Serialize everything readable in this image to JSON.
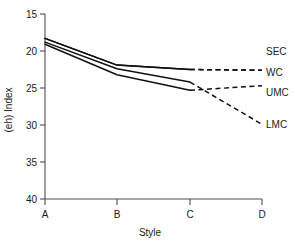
{
  "chart_data": {
    "type": "line",
    "title": "",
    "xlabel": "Style",
    "ylabel": "(eh) Index",
    "categories": [
      "A",
      "B",
      "C",
      "D"
    ],
    "x_ticks": [
      "A",
      "B",
      "C",
      "D"
    ],
    "y_ticks": [
      "15",
      "20",
      "25",
      "30",
      "35",
      "40"
    ],
    "ylim": [
      15,
      40
    ],
    "y_inverted": true,
    "grid": false,
    "legend_position": "right",
    "series": [
      {
        "name": "SEC",
        "label": "SEC",
        "x": [
          "A",
          "B",
          "C",
          "D"
        ],
        "values": [
          18.3,
          21.9,
          22.5,
          22.6
        ],
        "solid_through": "C",
        "dashed_from": "C",
        "legend_label": "SEC"
      },
      {
        "name": "WC",
        "label": "WC",
        "x": [
          "A",
          "B",
          "C",
          "D"
        ],
        "values": [
          18.3,
          21.9,
          22.5,
          22.6
        ],
        "solid_through": "C",
        "dashed_from": "C",
        "legend_label": "WC"
      },
      {
        "name": "UMC",
        "label": "UMC",
        "x": [
          "A",
          "B",
          "C",
          "D"
        ],
        "values": [
          19.1,
          23.2,
          25.3,
          24.7
        ],
        "solid_through": "C",
        "dashed_from": "C",
        "legend_label": "UMC"
      },
      {
        "name": "LMC",
        "label": "LMC",
        "x": [
          "A",
          "B",
          "C",
          "D"
        ],
        "values": [
          18.8,
          22.4,
          24.2,
          29.9
        ],
        "solid_through": "C",
        "dashed_from": "C",
        "legend_label": "LMC"
      }
    ],
    "legend_entries": [
      "SEC",
      "WC",
      "UMC",
      "LMC"
    ]
  }
}
